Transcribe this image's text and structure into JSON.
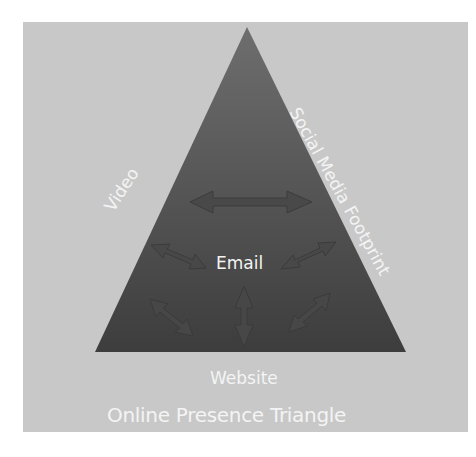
{
  "diagram": {
    "title": "Online Presence Triangle",
    "vertices": {
      "top": "",
      "left_edge_label": "Video",
      "right_edge_label": "Social Media Footprint",
      "bottom_label": "Website"
    },
    "center_label": "Email",
    "colors": {
      "background": "#c8c8c8",
      "triangle_top": "#6e6e6e",
      "triangle_bottom": "#3f3f3f",
      "arrow": "#4a4a4a",
      "text": "#f4f4f4"
    },
    "arrows": [
      {
        "name": "horizontal-double-arrow",
        "direction": "left-right"
      },
      {
        "name": "upper-left-arrow",
        "direction": "diagonal"
      },
      {
        "name": "upper-right-arrow",
        "direction": "diagonal"
      },
      {
        "name": "lower-left-arrow",
        "direction": "diagonal"
      },
      {
        "name": "vertical-double-arrow",
        "direction": "up-down"
      },
      {
        "name": "lower-right-arrow",
        "direction": "diagonal"
      }
    ]
  }
}
